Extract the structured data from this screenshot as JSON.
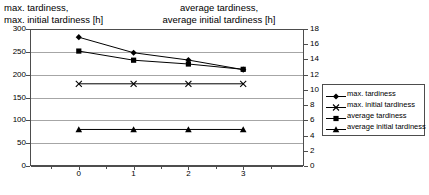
{
  "left_axis_title": "max. tardiness,\nmax. initial tardiness [h]",
  "right_axis_title": "average tardiness,\naverage initial tardiness [h]",
  "legend": {
    "items": [
      {
        "label": "max. tardiness",
        "marker": "diamond-marker",
        "color": "#000000"
      },
      {
        "label": "max. initial tardiness",
        "marker": "cross-marker",
        "color": "#000000"
      },
      {
        "label": "average tardiness",
        "marker": "square-marker",
        "color": "#000000"
      },
      {
        "label": "average initial tardiness",
        "marker": "triangle-marker",
        "color": "#000000"
      }
    ]
  },
  "chart_data": {
    "type": "line",
    "title": "",
    "xlabel": "",
    "x": [
      0,
      1,
      2,
      3
    ],
    "xtick_labels": [
      "0",
      "1",
      "2",
      "3"
    ],
    "grid": true,
    "legend_position": "right",
    "left_axis": {
      "label": "max. tardiness, max. initial tardiness [h]",
      "ylim": [
        0,
        300
      ],
      "ticks": [
        0,
        50,
        100,
        150,
        200,
        250,
        300
      ],
      "tick_labels": [
        "0",
        "50",
        "100",
        "150",
        "200",
        "250",
        "300"
      ]
    },
    "right_axis": {
      "label": "average tardiness, average initial tardiness [h]",
      "ylim": [
        0,
        18
      ],
      "ticks": [
        0,
        2,
        4,
        6,
        8,
        10,
        12,
        14,
        16,
        18
      ],
      "tick_labels": [
        "0",
        "2",
        "4",
        "6",
        "8",
        "10",
        "12",
        "14",
        "16",
        "18"
      ]
    },
    "series": [
      {
        "name": "max. tardiness",
        "axis": "left",
        "marker": "diamond",
        "values": [
          282,
          248,
          232,
          211
        ]
      },
      {
        "name": "max. initial tardiness",
        "axis": "left",
        "marker": "cross",
        "values": [
          180,
          180,
          180,
          180
        ]
      },
      {
        "name": "average tardiness",
        "axis": "right",
        "marker": "square",
        "values": [
          15.1,
          13.9,
          13.4,
          12.7
        ]
      },
      {
        "name": "average initial tardiness",
        "axis": "right",
        "marker": "triangle",
        "values": [
          4.8,
          4.8,
          4.8,
          4.8
        ]
      }
    ]
  }
}
